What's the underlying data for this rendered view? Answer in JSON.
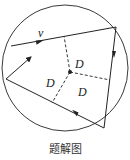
{
  "diagram": {
    "caption": "题解图",
    "velocity_label": "v",
    "distance_labels": [
      "D",
      "D",
      "D"
    ],
    "colors": {
      "stroke": "#222222",
      "background": "#ffffff"
    },
    "circle": {
      "cx": 65,
      "cy": 68,
      "r": 63
    },
    "center_point": {
      "x": 70,
      "y": 72
    },
    "path_segments": [
      {
        "name": "top-segment",
        "from": [
          11,
          46
        ],
        "to": [
          116,
          27
        ],
        "arrow_at": [
          41,
          41
        ],
        "direction": "right"
      },
      {
        "name": "right-segment",
        "from": [
          116,
          27
        ],
        "to": [
          104,
          128
        ],
        "arrow_at": [
          114,
          55
        ],
        "direction": "down"
      },
      {
        "name": "bottom-segment",
        "from": [
          104,
          128
        ],
        "to": [
          6,
          79
        ],
        "arrow_at": [
          74,
          112
        ],
        "direction": "left"
      }
    ],
    "initial_velocity_arrow": {
      "from": [
        6,
        79
      ],
      "to": [
        31,
        57
      ]
    },
    "dashed_perpendiculars": [
      {
        "to": [
          64,
          36
        ]
      },
      {
        "to": [
          110,
          80
        ]
      },
      {
        "to": [
          52,
          103
        ]
      }
    ]
  }
}
